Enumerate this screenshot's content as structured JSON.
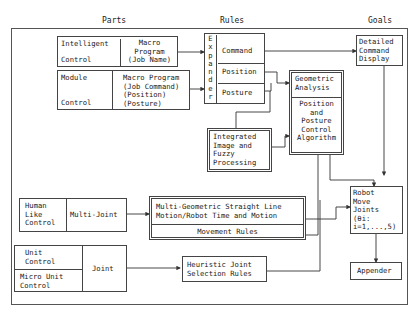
{
  "headers": {
    "parts": "Parts",
    "rules": "Rules",
    "goals": "Goals"
  },
  "parts": {
    "intelligent_control": {
      "label_top": "Intelligent",
      "label_bottom": "Control",
      "program": "Macro\nProgram\n(Job Name)"
    },
    "module_control": {
      "label_top": "Module",
      "label_bottom": "Control",
      "program": "Macro Program\n(Job Command)\n(Position)\n(Posture)"
    },
    "human_like_control": {
      "label": "Human\nLike\nControl",
      "type": "Multi-Joint"
    },
    "unit_control": {
      "label_top": "Unit\nControl",
      "label_bottom": "Micro Unit\nControl",
      "type": "Joint"
    }
  },
  "rules": {
    "expander": "E\nx\np\na\nn\nd\ne\nr",
    "command": "Command",
    "position": "Position",
    "posture": "Posture",
    "integrated": "Integrated\nImage and\nFuzzy\nProcessing",
    "geometric_analysis": "Geometric\nAnalysis",
    "position_posture_algorithm": "Position\nand\nPosture\nControl\nAlgorithm",
    "multi_geometric": "Multi-Geometric Straight Line\nMotion/Robot Time and Motion",
    "movement_rules": "Movement Rules",
    "heuristic": "Heuristic Joint\nSelection Rules"
  },
  "goals": {
    "detailed_display": "Detailed\nCommand\nDisplay",
    "robot_move": "Robot\nMove\nJoints\n(θi:\ni=1,...,5)",
    "appender": "Appender"
  }
}
